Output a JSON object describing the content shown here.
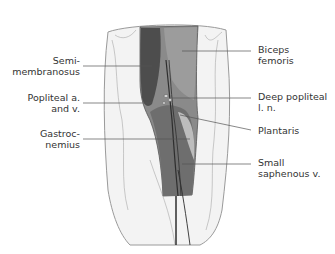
{
  "diagram": {
    "colors": {
      "background": "#ffffff",
      "skin": "#f2f2f2",
      "skin_outline": "#9a9a9a",
      "muscle_dark": "#4a4a4a",
      "muscle_mid": "#7a7a7a",
      "muscle_light": "#bdbdbd",
      "leader_line": "#555555",
      "text": "#333333"
    },
    "labels": {
      "left": [
        {
          "id": "semimembranosus",
          "text": "Semi-\nmembranosus"
        },
        {
          "id": "popliteal",
          "text": "Popliteal a.\nand v."
        },
        {
          "id": "gastrocnemius",
          "text": "Gastroc-\nnemius"
        }
      ],
      "right": [
        {
          "id": "biceps",
          "text": "Biceps\nfemoris"
        },
        {
          "id": "deep_popliteal",
          "text": "Deep popliteal\nl. n."
        },
        {
          "id": "plantaris",
          "text": "Plantaris"
        },
        {
          "id": "small_saphenous",
          "text": "Small\nsaphenous v."
        }
      ]
    }
  }
}
